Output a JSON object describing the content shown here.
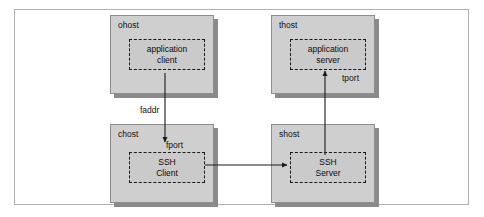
{
  "diagram": {
    "canvas": {
      "width": 484,
      "height": 217
    },
    "colors": {
      "frame_border": "#b0b0b0",
      "host_fill": "#cfcfcf",
      "host_border": "#8e8e8e",
      "host_shadow": "#8a8a8a",
      "inner_fill": "#cacaca",
      "inner_border": "#1a1a1a",
      "arrow": "#1a1a1a",
      "text": "#111111",
      "background": "#ffffff"
    },
    "hosts": [
      {
        "id": "ohost",
        "label": "ohost",
        "component_line1": "application",
        "component_line2": "client"
      },
      {
        "id": "thost",
        "label": "thost",
        "component_line1": "application",
        "component_line2": "server"
      },
      {
        "id": "chost",
        "label": "chost",
        "component_line1": "SSH",
        "component_line2": "Client"
      },
      {
        "id": "shost",
        "label": "shost",
        "component_line1": "SSH",
        "component_line2": "Server"
      }
    ],
    "annotations": [
      {
        "id": "faddr",
        "label": "faddr"
      },
      {
        "id": "fport",
        "label": "fport"
      },
      {
        "id": "tport",
        "label": "tport"
      }
    ],
    "arrows": [
      {
        "id": "client-to-sshclient",
        "direction": "down",
        "from": "application client",
        "to": "SSH Client"
      },
      {
        "id": "sshclient-to-sshserver",
        "direction": "right",
        "from": "SSH Client",
        "to": "SSH Server"
      },
      {
        "id": "sshserver-to-appserver",
        "direction": "up",
        "from": "SSH Server",
        "to": "application server"
      }
    ]
  }
}
